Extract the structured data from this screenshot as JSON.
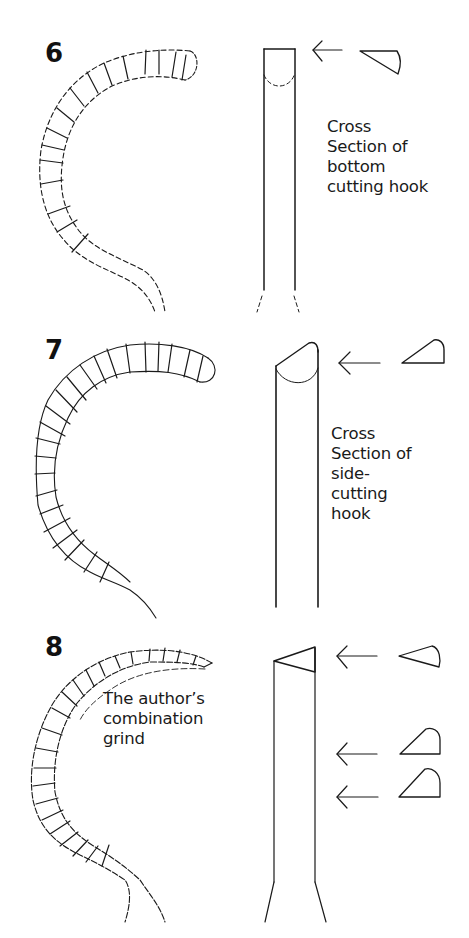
{
  "figures": [
    {
      "number": "6",
      "caption": "Cross\nSection of\nbottom\ncutting hook",
      "arrows": 1,
      "cross_sections": [
        "wedge-bottom-cutting"
      ]
    },
    {
      "number": "7",
      "caption": "Cross\nSection of\nside-\ncutting\nhook",
      "arrows": 1,
      "cross_sections": [
        "wedge-side-cutting"
      ]
    },
    {
      "number": "8",
      "caption": "The author’s\ncombination\ngrind",
      "arrows": 3,
      "cross_sections": [
        "wedge-tip",
        "wedge-mid",
        "wedge-base"
      ]
    }
  ],
  "colors": {
    "ink": "#1a1a1a",
    "background": "#ffffff"
  }
}
